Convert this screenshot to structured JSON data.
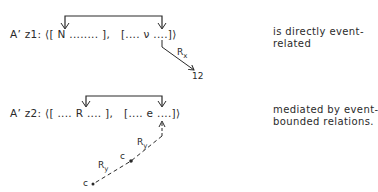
{
  "row1": {
    "formula": "A’ z1: ⟨[ N ........ ],   [.... ν ....]⟩",
    "relation_label": "R",
    "relation_sub": "x",
    "target": "12",
    "note_line1": "is directly event-",
    "note_line2": "related"
  },
  "row2": {
    "formula": "A’ z2: ⟨[ .... R .... ],   [.... e ....]⟩",
    "relation_label_1": "R",
    "relation_sub_1": "y",
    "relation_label_2": "R",
    "relation_sub_2": "y",
    "node_1": "c",
    "node_2": "c",
    "note_line1": "mediated by event-",
    "note_line2": "bounded relations."
  },
  "colors": {
    "ink": "#2a2a2a",
    "background": "#ffffff"
  }
}
